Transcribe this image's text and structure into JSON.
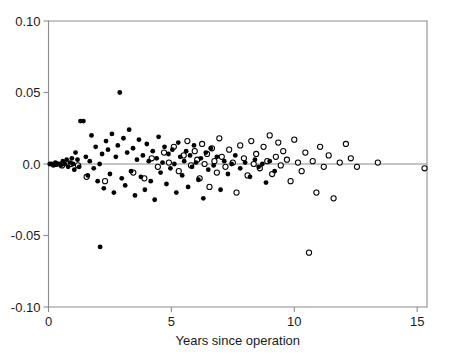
{
  "chart_data": {
    "type": "scatter",
    "title": "",
    "xlabel": "Years since operation",
    "ylabel": "",
    "xlim": [
      0,
      15.4
    ],
    "ylim": [
      -0.1,
      0.1
    ],
    "xticks": [
      0,
      5,
      10,
      15
    ],
    "xtick_labels": [
      "0",
      "5",
      "10",
      "15"
    ],
    "yticks": [
      0.1,
      0.05,
      0.0,
      -0.05,
      -0.1
    ],
    "ytick_labels": [
      "0.10",
      "0.05",
      "0.0",
      "-0.05",
      "-0.10"
    ],
    "grid": false,
    "legend": "none",
    "reference_lines": [
      {
        "orientation": "horizontal",
        "y": 0.0,
        "color": "#8c8c8c"
      }
    ],
    "annotations": [],
    "marker_colors": {
      "filled": "#000000",
      "open_edge": "#000000",
      "open_fill": "#ffffff",
      "axis": "#8c8c8c"
    },
    "series": [
      {
        "name": "filled",
        "marker": "filled-circle",
        "points": [
          [
            0.05,
            0.0
          ],
          [
            0.12,
            0.0
          ],
          [
            0.2,
            -0.001
          ],
          [
            0.28,
            0.001
          ],
          [
            0.34,
            0.0
          ],
          [
            0.42,
            0.0
          ],
          [
            0.5,
            -0.001
          ],
          [
            0.58,
            0.002
          ],
          [
            0.66,
            0.0
          ],
          [
            0.74,
            0.003
          ],
          [
            0.8,
            -0.002
          ],
          [
            0.88,
            0.001
          ],
          [
            0.95,
            0.004
          ],
          [
            1.0,
            0.0
          ],
          [
            1.05,
            -0.004
          ],
          [
            1.1,
            0.008
          ],
          [
            1.18,
            0.003
          ],
          [
            1.25,
            -0.002
          ],
          [
            1.3,
            0.03
          ],
          [
            1.42,
            0.03
          ],
          [
            1.52,
            0.005
          ],
          [
            1.6,
            -0.008
          ],
          [
            1.68,
            0.002
          ],
          [
            1.75,
            0.02
          ],
          [
            1.84,
            -0.003
          ],
          [
            1.92,
            0.012
          ],
          [
            2.0,
            -0.012
          ],
          [
            2.08,
            0.0
          ],
          [
            2.1,
            -0.058
          ],
          [
            2.18,
            0.007
          ],
          [
            2.25,
            -0.017
          ],
          [
            2.34,
            0.016
          ],
          [
            2.42,
            0.01
          ],
          [
            2.5,
            -0.007
          ],
          [
            2.58,
            0.021
          ],
          [
            2.66,
            -0.02
          ],
          [
            2.74,
            0.005
          ],
          [
            2.82,
            0.013
          ],
          [
            2.9,
            0.05
          ],
          [
            2.98,
            -0.01
          ],
          [
            3.05,
            0.018
          ],
          [
            3.12,
            -0.015
          ],
          [
            3.2,
            0.008
          ],
          [
            3.28,
            0.024
          ],
          [
            3.36,
            -0.005
          ],
          [
            3.44,
            0.011
          ],
          [
            3.52,
            -0.022
          ],
          [
            3.6,
            0.003
          ],
          [
            3.68,
            0.017
          ],
          [
            3.76,
            -0.009
          ],
          [
            3.84,
            0.006
          ],
          [
            3.92,
            -0.018
          ],
          [
            4.0,
            0.014
          ],
          [
            4.08,
            0.002
          ],
          [
            4.16,
            -0.012
          ],
          [
            4.24,
            0.009
          ],
          [
            4.32,
            -0.025
          ],
          [
            4.4,
            0.004
          ],
          [
            4.48,
            0.019
          ],
          [
            4.56,
            -0.006
          ],
          [
            4.64,
            0.001
          ],
          [
            4.72,
            0.012
          ],
          [
            4.8,
            -0.014
          ],
          [
            4.88,
            0.007
          ],
          [
            4.96,
            -0.003
          ],
          [
            5.04,
            0.01
          ],
          [
            5.12,
            0.0
          ],
          [
            5.2,
            -0.02
          ],
          [
            5.28,
            0.015
          ],
          [
            5.36,
            0.005
          ],
          [
            5.44,
            -0.008
          ],
          [
            5.52,
            0.002
          ],
          [
            5.6,
            0.009
          ],
          [
            5.68,
            -0.016
          ],
          [
            5.76,
            0.006
          ],
          [
            5.84,
            -0.002
          ],
          [
            5.92,
            0.013
          ],
          [
            6.0,
            0.001
          ],
          [
            6.1,
            -0.011
          ],
          [
            6.2,
            0.004
          ],
          [
            6.3,
            -0.024
          ],
          [
            6.4,
            0.008
          ],
          [
            6.5,
            -0.004
          ],
          [
            6.6,
            0.011
          ],
          [
            6.72,
            -0.001
          ],
          [
            6.85,
            0.005
          ],
          [
            7.0,
            -0.018
          ],
          [
            7.15,
            0.002
          ],
          [
            7.3,
            -0.007
          ],
          [
            7.45,
            0.0
          ],
          [
            7.6,
            0.006
          ],
          [
            7.8,
            -0.003
          ],
          [
            8.0,
            0.001
          ],
          [
            8.2,
            -0.009
          ],
          [
            8.4,
            0.003
          ],
          [
            8.55,
            -0.002
          ],
          [
            8.7,
            0.0
          ],
          [
            8.85,
            -0.013
          ],
          [
            9.0,
            0.002
          ],
          [
            9.2,
            -0.005
          ]
        ]
      },
      {
        "name": "open",
        "marker": "open-circle",
        "points": [
          [
            0.3,
            0.0
          ],
          [
            0.55,
            -0.001
          ],
          [
            0.9,
            0.0
          ],
          [
            1.2,
            -0.001
          ],
          [
            1.55,
            -0.009
          ],
          [
            2.3,
            -0.012
          ],
          [
            3.45,
            -0.006
          ],
          [
            3.9,
            -0.01
          ],
          [
            4.2,
            0.004
          ],
          [
            4.45,
            -0.002
          ],
          [
            4.7,
            0.008
          ],
          [
            4.9,
            0.001
          ],
          [
            5.1,
            0.012
          ],
          [
            5.3,
            -0.005
          ],
          [
            5.5,
            0.006
          ],
          [
            5.65,
            0.016
          ],
          [
            5.8,
            -0.001
          ],
          [
            5.95,
            0.009
          ],
          [
            6.05,
            0.003
          ],
          [
            6.15,
            -0.01
          ],
          [
            6.25,
            0.014
          ],
          [
            6.35,
            0.0
          ],
          [
            6.45,
            0.007
          ],
          [
            6.55,
            -0.016
          ],
          [
            6.65,
            0.011
          ],
          [
            6.75,
            0.002
          ],
          [
            6.85,
            -0.006
          ],
          [
            6.95,
            0.018
          ],
          [
            7.05,
            0.005
          ],
          [
            7.2,
            -0.002
          ],
          [
            7.35,
            0.01
          ],
          [
            7.5,
            0.001
          ],
          [
            7.65,
            -0.02
          ],
          [
            7.8,
            0.013
          ],
          [
            7.95,
            0.004
          ],
          [
            8.1,
            -0.008
          ],
          [
            8.25,
            0.016
          ],
          [
            8.35,
            0.0
          ],
          [
            8.45,
            0.007
          ],
          [
            8.6,
            -0.003
          ],
          [
            8.75,
            0.012
          ],
          [
            8.9,
            0.002
          ],
          [
            9.0,
            0.02
          ],
          [
            9.1,
            -0.007
          ],
          [
            9.25,
            0.005
          ],
          [
            9.35,
            0.015
          ],
          [
            9.45,
            -0.001
          ],
          [
            9.55,
            0.009
          ],
          [
            9.7,
            0.003
          ],
          [
            9.85,
            -0.012
          ],
          [
            10.0,
            0.017
          ],
          [
            10.15,
            0.001
          ],
          [
            10.3,
            -0.005
          ],
          [
            10.45,
            0.008
          ],
          [
            10.6,
            -0.062
          ],
          [
            10.75,
            0.002
          ],
          [
            10.9,
            -0.02
          ],
          [
            11.05,
            0.012
          ],
          [
            11.2,
            -0.002
          ],
          [
            11.4,
            0.006
          ],
          [
            11.6,
            -0.024
          ],
          [
            11.85,
            0.001
          ],
          [
            12.1,
            0.014
          ],
          [
            12.3,
            0.004
          ],
          [
            12.55,
            -0.002
          ],
          [
            13.4,
            0.001
          ],
          [
            15.3,
            -0.003
          ]
        ]
      }
    ]
  }
}
